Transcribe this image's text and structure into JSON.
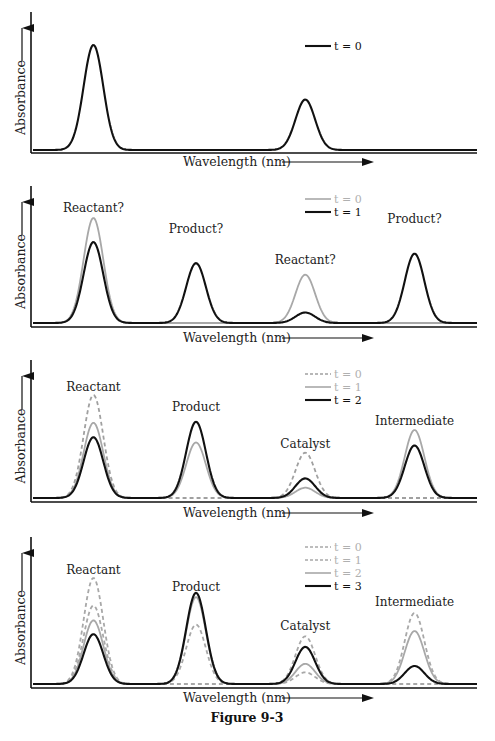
{
  "figure_caption": "Figure 9-3",
  "chart_data": [
    {
      "type": "line",
      "panel": 1,
      "xlabel": "Wavelength (nm)",
      "ylabel": "Absorbance",
      "peak_positions": [
        0.14,
        0.615
      ],
      "series": [
        {
          "name": "t = 0",
          "style": "solid",
          "color": "#111111",
          "peaks": [
            1.0,
            0.48
          ]
        }
      ],
      "peak_labels": []
    },
    {
      "type": "line",
      "panel": 2,
      "xlabel": "Wavelength (nm)",
      "ylabel": "Absorbance",
      "peak_positions": [
        0.14,
        0.37,
        0.615,
        0.86
      ],
      "series": [
        {
          "name": "t = 0",
          "style": "solid",
          "color": "#a8a8a8",
          "peaks": [
            1.0,
            0.0,
            0.46,
            0.0
          ]
        },
        {
          "name": "t = 1",
          "style": "solid",
          "color": "#111111",
          "peaks": [
            0.77,
            0.57,
            0.1,
            0.66
          ]
        }
      ],
      "peak_labels": [
        "Reactant?",
        "Product?",
        "Reactant?",
        "Product?"
      ]
    },
    {
      "type": "line",
      "panel": 3,
      "xlabel": "Wavelength (nm)",
      "ylabel": "Absorbance",
      "peak_positions": [
        0.14,
        0.37,
        0.615,
        0.86
      ],
      "series": [
        {
          "name": "t = 0",
          "style": "dashed",
          "color": "#a0a0a0",
          "peaks": [
            1.0,
            0.0,
            0.44,
            0.0
          ]
        },
        {
          "name": "t = 1",
          "style": "solid",
          "color": "#a8a8a8",
          "peaks": [
            0.73,
            0.54,
            0.1,
            0.66
          ]
        },
        {
          "name": "t = 2",
          "style": "solid",
          "color": "#111111",
          "peaks": [
            0.59,
            0.74,
            0.19,
            0.51
          ]
        }
      ],
      "peak_labels": [
        "Reactant",
        "Product",
        "Catalyst",
        "Intermediate"
      ]
    },
    {
      "type": "line",
      "panel": 4,
      "xlabel": "Wavelength (nm)",
      "ylabel": "Absorbance",
      "peak_positions": [
        0.14,
        0.37,
        0.615,
        0.86
      ],
      "series": [
        {
          "name": "t = 0",
          "style": "dashed",
          "color": "#a8a8a8",
          "peaks": [
            1.0,
            0.0,
            0.45,
            0.0
          ]
        },
        {
          "name": "t = 1",
          "style": "dashed",
          "color": "#a8a8a8",
          "peaks": [
            0.74,
            0.56,
            0.11,
            0.67
          ]
        },
        {
          "name": "t = 2",
          "style": "solid",
          "color": "#a8a8a8",
          "peaks": [
            0.6,
            0.82,
            0.19,
            0.5
          ]
        },
        {
          "name": "t = 3",
          "style": "solid",
          "color": "#111111",
          "peaks": [
            0.47,
            0.86,
            0.35,
            0.17
          ]
        }
      ],
      "peak_labels": [
        "Reactant",
        "Product",
        "Catalyst",
        "Intermediate"
      ]
    }
  ]
}
